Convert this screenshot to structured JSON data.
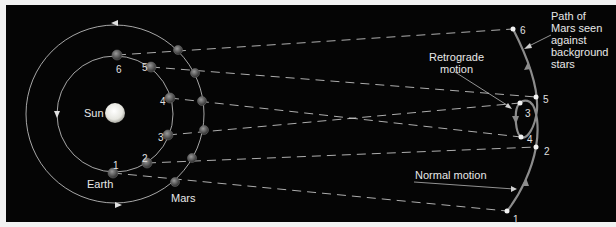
{
  "labels": {
    "sun": "Sun",
    "earth": "Earth",
    "mars": "Mars",
    "retrograde": "Retrograde\nmotion",
    "normal": "Normal motion",
    "path": "Path of\nMars seen\nagainst\nbackground\nstars"
  },
  "earth_positions": [
    {
      "n": "1",
      "x": 113,
      "y": 173
    },
    {
      "n": "2",
      "x": 147,
      "y": 163
    },
    {
      "n": "3",
      "x": 168,
      "y": 135
    },
    {
      "n": "4",
      "x": 170,
      "y": 98
    },
    {
      "n": "5",
      "x": 151,
      "y": 67
    },
    {
      "n": "6",
      "x": 117,
      "y": 55
    }
  ],
  "mars_positions": [
    {
      "n": "1",
      "x": 175,
      "y": 182
    },
    {
      "n": "2",
      "x": 192,
      "y": 158
    },
    {
      "n": "3",
      "x": 204,
      "y": 130
    },
    {
      "n": "4",
      "x": 202,
      "y": 101
    },
    {
      "n": "5",
      "x": 195,
      "y": 73
    },
    {
      "n": "6",
      "x": 178,
      "y": 50
    }
  ],
  "sky_positions": [
    {
      "n": "1",
      "x": 507,
      "y": 211
    },
    {
      "n": "2",
      "x": 536,
      "y": 147
    },
    {
      "n": "3",
      "x": 520,
      "y": 103
    },
    {
      "n": "4",
      "x": 521,
      "y": 137
    },
    {
      "n": "5",
      "x": 536,
      "y": 97
    },
    {
      "n": "6",
      "x": 513,
      "y": 29
    }
  ],
  "colors": {
    "background": "#050505",
    "orbit": "#cfcfcf",
    "path": "#8c8c8c",
    "sun": "#f4f4f0",
    "planet": "#5a5a5a"
  }
}
